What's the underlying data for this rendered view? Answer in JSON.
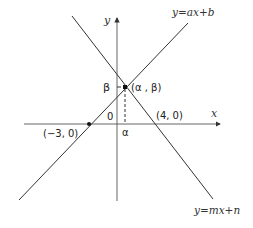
{
  "diagram": {
    "type": "coordinate-plane",
    "axes": {
      "x_label": "x",
      "y_label": "y",
      "origin_label": "0"
    },
    "lines": [
      {
        "name": "line-ax-b",
        "label": "y=ax+b",
        "passes_through": [
          "(−3, 0)",
          "(α, β)"
        ]
      },
      {
        "name": "line-mx-n",
        "label": "y=mx+n",
        "passes_through": [
          "(4, 0)",
          "(α, β)"
        ]
      }
    ],
    "points": {
      "intersection": "(α , β)",
      "neg3": "(−3, 0)",
      "pos4": "(4, 0)"
    },
    "tick_labels": {
      "beta": "β",
      "alpha": "α"
    },
    "colors": {
      "line": "#333333",
      "background": "#ffffff"
    }
  }
}
